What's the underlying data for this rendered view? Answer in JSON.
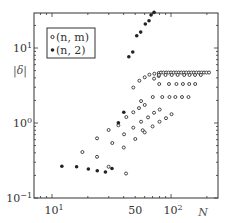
{
  "chart_data": {
    "type": "scatter",
    "title": "",
    "xlabel": "N",
    "ylabel": "|δ|",
    "xscale": "log",
    "yscale": "log",
    "xlim": [
      7.06,
      248
    ],
    "ylim": [
      0.1,
      29.3
    ],
    "grid": false,
    "legend_position": "top-left",
    "x_ticks": [
      {
        "value": 10,
        "label_base": "10",
        "label_exp": "1"
      },
      {
        "value": 50,
        "label_base": "50",
        "label_exp": ""
      },
      {
        "value": 100,
        "label_base": "10",
        "label_exp": "2"
      }
    ],
    "y_ticks": [
      {
        "value": 0.1,
        "label_base": "10",
        "label_exp": "−1"
      },
      {
        "value": 1,
        "label_base": "10",
        "label_exp": "0"
      },
      {
        "value": 10,
        "label_base": "10",
        "label_exp": "1"
      }
    ],
    "series": [
      {
        "name": "(n,m)",
        "marker": "open-circle",
        "color": "#333333",
        "points": [
          [
            18.0,
            0.41
          ],
          [
            23.9,
            0.354
          ],
          [
            23.9,
            0.625
          ],
          [
            29.9,
            0.261
          ],
          [
            29.9,
            0.807
          ],
          [
            32.1,
            0.541
          ],
          [
            36.1,
            0.932
          ],
          [
            40.1,
            0.471
          ],
          [
            40.3,
            0.707
          ],
          [
            42.1,
            1.2
          ],
          [
            41.9,
            0.212
          ],
          [
            48.2,
            1.39
          ],
          [
            48.2,
            0.866
          ],
          [
            48.2,
            2.97
          ],
          [
            50.1,
            0.612
          ],
          [
            53.8,
            1.58
          ],
          [
            54.2,
            3.66
          ],
          [
            56.0,
            1.96
          ],
          [
            56.0,
            1.04
          ],
          [
            57.8,
            0.8
          ],
          [
            60.1,
            4.07
          ],
          [
            60.1,
            1.74
          ],
          [
            60.1,
            0.75
          ],
          [
            64.1,
            1.19
          ],
          [
            65.8,
            4.41
          ],
          [
            70.0,
            0.9
          ],
          [
            72.0,
            1.37
          ],
          [
            72.4,
            4.54
          ],
          [
            72.0,
            3.9
          ],
          [
            80.0,
            1.04
          ],
          [
            80.3,
            1.51
          ],
          [
            78.8,
            4.64
          ],
          [
            78.8,
            4.23
          ],
          [
            90.7,
            1.16
          ],
          [
            101,
            1.31
          ],
          [
            82.4,
            4.71
          ],
          [
            86.5,
            4.71
          ],
          [
            91,
            4.71
          ],
          [
            95.5,
            4.71
          ],
          [
            100.3,
            4.71
          ],
          [
            105.3,
            4.71
          ],
          [
            110.6,
            4.71
          ],
          [
            116.1,
            4.71
          ],
          [
            121.9,
            4.71
          ],
          [
            128,
            4.71
          ],
          [
            134.4,
            4.71
          ],
          [
            141.2,
            4.71
          ],
          [
            148.2,
            4.71
          ],
          [
            155.6,
            4.71
          ],
          [
            163.4,
            4.71
          ],
          [
            171.6,
            4.71
          ],
          [
            180.2,
            4.71
          ],
          [
            189.2,
            4.71
          ],
          [
            198.6,
            4.71
          ],
          [
            208.6,
            4.71
          ],
          [
            79.1,
            4.37
          ],
          [
            89.9,
            4.37
          ],
          [
            101.3,
            4.37
          ],
          [
            113.6,
            4.37
          ],
          [
            128.9,
            4.37
          ],
          [
            143,
            4.37
          ],
          [
            159,
            4.37
          ],
          [
            178,
            4.37
          ],
          [
            79.6,
            3.31
          ],
          [
            96.1,
            3.31
          ],
          [
            111,
            3.31
          ],
          [
            125.8,
            3.31
          ],
          [
            142.1,
            3.31
          ],
          [
            159.5,
            3.31
          ],
          [
            70.2,
            2.22
          ],
          [
            84.4,
            2.22
          ],
          [
            97,
            2.22
          ],
          [
            108.7,
            2.22
          ],
          [
            123.6,
            2.22
          ],
          [
            140,
            2.22
          ]
        ]
      },
      {
        "name": "(n,2)",
        "marker": "filled-circle",
        "color": "#222222",
        "points": [
          [
            12.1,
            0.265
          ],
          [
            16.1,
            0.261
          ],
          [
            20.2,
            0.244
          ],
          [
            24.0,
            0.231
          ],
          [
            28.1,
            0.222
          ],
          [
            31.9,
            0.247
          ],
          [
            36.1,
            1.01
          ],
          [
            40.1,
            1.39
          ],
          [
            44.2,
            7.66
          ],
          [
            47.7,
            8.85
          ],
          [
            51.5,
            14.6
          ],
          [
            55.6,
            16.3
          ],
          [
            60.8,
            20.9
          ],
          [
            65.3,
            23.1
          ],
          [
            67.9,
            27.5
          ],
          [
            72.0,
            29.9
          ]
        ]
      }
    ],
    "legend": [
      {
        "label": "(n, m)",
        "marker": "open-circle"
      },
      {
        "label": "(n, 2)",
        "marker": "filled-circle"
      }
    ]
  }
}
